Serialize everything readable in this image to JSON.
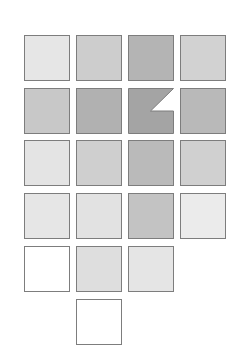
{
  "diagram": {
    "border_color": "#7d7d7d",
    "tiles": [
      {
        "row": 1,
        "col": 1,
        "x": 24,
        "y": 35,
        "fill": "#e6e6e6"
      },
      {
        "row": 1,
        "col": 2,
        "x": 76,
        "y": 35,
        "fill": "#cdcdcd"
      },
      {
        "row": 1,
        "col": 3,
        "x": 128,
        "y": 35,
        "fill": "#b4b4b4"
      },
      {
        "row": 1,
        "col": 4,
        "x": 180,
        "y": 35,
        "fill": "#d2d2d2"
      },
      {
        "row": 2,
        "col": 1,
        "x": 24,
        "y": 88,
        "fill": "#c8c8c8"
      },
      {
        "row": 2,
        "col": 2,
        "x": 76,
        "y": 88,
        "fill": "#b1b1b1"
      },
      {
        "row": 2,
        "col": 3,
        "x": 128,
        "y": 88,
        "fill": "#a4a4a4",
        "notched": true
      },
      {
        "row": 2,
        "col": 4,
        "x": 180,
        "y": 88,
        "fill": "#b9b9b9"
      },
      {
        "row": 3,
        "col": 1,
        "x": 24,
        "y": 140,
        "fill": "#e4e4e4"
      },
      {
        "row": 3,
        "col": 2,
        "x": 76,
        "y": 140,
        "fill": "#cfcfcf"
      },
      {
        "row": 3,
        "col": 3,
        "x": 128,
        "y": 140,
        "fill": "#bababa"
      },
      {
        "row": 3,
        "col": 4,
        "x": 180,
        "y": 140,
        "fill": "#d0d0d0"
      },
      {
        "row": 4,
        "col": 1,
        "x": 24,
        "y": 193,
        "fill": "#e6e6e6"
      },
      {
        "row": 4,
        "col": 2,
        "x": 76,
        "y": 193,
        "fill": "#e2e2e2"
      },
      {
        "row": 4,
        "col": 3,
        "x": 128,
        "y": 193,
        "fill": "#c3c3c3"
      },
      {
        "row": 4,
        "col": 4,
        "x": 180,
        "y": 193,
        "fill": "#ebebeb"
      },
      {
        "row": 5,
        "col": 1,
        "x": 24,
        "y": 246,
        "fill": "#ffffff"
      },
      {
        "row": 5,
        "col": 2,
        "x": 76,
        "y": 246,
        "fill": "#dedede"
      },
      {
        "row": 5,
        "col": 3,
        "x": 128,
        "y": 246,
        "fill": "#e5e5e5"
      },
      {
        "row": 6,
        "col": 2,
        "x": 76,
        "y": 299,
        "fill": "#ffffff"
      }
    ]
  }
}
